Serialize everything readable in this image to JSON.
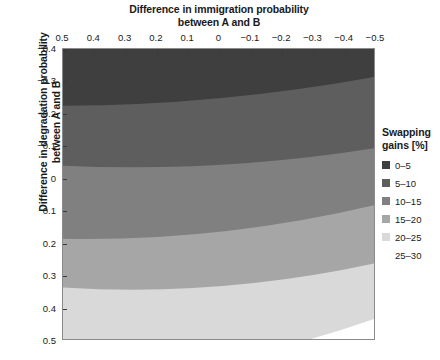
{
  "chart_data": {
    "type": "heatmap",
    "title": "Difference in immigration probability between A and B",
    "xlabel": "Difference in immigration probability between A and B",
    "ylabel": "Difference in degradation probability between A and B",
    "xlabel_line1": "Difference in immigration probability",
    "xlabel_line2": "between A and B",
    "ylabel_line1": "Difference in degradation probability",
    "ylabel_line2": "between A and B",
    "xlim": [
      0.5,
      -0.5
    ],
    "ylim": [
      -0.4,
      0.5
    ],
    "x_axis_position": "top",
    "y_axis_direction": "inverted",
    "grid": false,
    "legend_position": "right",
    "xticks": [
      "0.5",
      "0.4",
      "0.3",
      "0.2",
      "0.1",
      "0",
      "−0.1",
      "−0.2",
      "−0.3",
      "−0.4",
      "−0.5"
    ],
    "xtick_values": [
      0.5,
      0.4,
      0.3,
      0.2,
      0.1,
      0,
      -0.1,
      -0.2,
      -0.3,
      -0.4,
      -0.5
    ],
    "yticks": [
      "−0.4",
      "−0.3",
      "−0.2",
      "−0.1",
      "0",
      "0.1",
      "0.2",
      "0.3",
      "0.4",
      "0.5"
    ],
    "ytick_values": [
      -0.4,
      -0.3,
      -0.2,
      -0.1,
      0,
      0.1,
      0.2,
      0.3,
      0.4,
      0.5
    ],
    "legend_title_line1": "Swapping",
    "legend_title_line2": "gains [%]",
    "legend_title": "Swapping gains [%]",
    "contour_levels": [
      0,
      5,
      10,
      15,
      20,
      25,
      30
    ],
    "bands": [
      {
        "label": "0–5",
        "color": "#3f3f3f",
        "range": [
          0,
          5
        ]
      },
      {
        "label": "5–10",
        "color": "#5e5e5e",
        "range": [
          5,
          10
        ]
      },
      {
        "label": "10–15",
        "color": "#808080",
        "range": [
          10,
          15
        ]
      },
      {
        "label": "15–20",
        "color": "#a6a6a6",
        "range": [
          15,
          20
        ]
      },
      {
        "label": "20–25",
        "color": "#d9d9d9",
        "range": [
          20,
          25
        ]
      },
      {
        "label": "25–30",
        "color": "#ffffff",
        "range": [
          25,
          30
        ]
      }
    ],
    "band_boundaries": [
      {
        "between": "0-5 / 5-10",
        "left_y": -0.225,
        "right_y": -0.315
      },
      {
        "between": "5-10 / 10-15",
        "left_y": -0.04,
        "right_y": -0.095
      },
      {
        "between": "10-15 / 15-20",
        "left_y": 0.185,
        "right_y": 0.08
      },
      {
        "between": "15-20 / 20-25",
        "left_y": 0.335,
        "right_y": 0.26
      },
      {
        "between": "20-25 / 25-30",
        "left_y": 0.61,
        "right_y": 0.43
      }
    ]
  }
}
